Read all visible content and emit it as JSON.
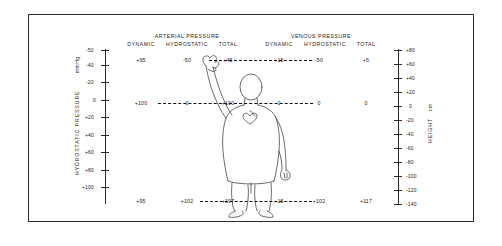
{
  "diagram": {
    "groups": [
      {
        "name": "arterial-pressure",
        "label": "ARTERIAL PRESSURE",
        "columns": [
          "DYNAMIC",
          "HYDROSTATIC",
          "TOTAL"
        ]
      },
      {
        "name": "venous-pressure",
        "label": "VENOUS PRESSURE",
        "columns": [
          "DYNAMIC",
          "HYDROSTATIC",
          "TOTAL"
        ]
      }
    ],
    "levels": [
      {
        "name": "raised-hand-level",
        "arterial": {
          "dynamic": "+95",
          "hydrostatic": "-50",
          "total": "+45"
        },
        "venous": {
          "dynamic": "+15",
          "hydrostatic": "-50",
          "total": "+5"
        }
      },
      {
        "name": "heart-level",
        "arterial": {
          "dynamic": "+100",
          "hydrostatic": "0",
          "total": "+100"
        },
        "venous": {
          "dynamic": "0",
          "hydrostatic": "0",
          "total": "0"
        }
      },
      {
        "name": "foot-level",
        "arterial": {
          "dynamic": "+95",
          "hydrostatic": "+102",
          "total": "+197"
        },
        "venous": {
          "dynamic": "+15",
          "hydrostatic": "+102",
          "total": "+117"
        }
      }
    ],
    "left_axis": {
      "title": "HYDROSTATIC PRESSURE",
      "unit": "mmHg",
      "ticks": [
        "-50",
        "-40",
        "-20",
        "0",
        "+20",
        "+40",
        "+60",
        "+80",
        "+100"
      ]
    },
    "right_axis": {
      "title": "HEIGHT",
      "unit": "cm",
      "ticks": [
        "+80",
        "+60",
        "+40",
        "+20",
        "0",
        "-20",
        "-40",
        "-60",
        "-80",
        "-100",
        "-120",
        "-140"
      ]
    },
    "anatomy": {
      "heart": "heart-icon",
      "figure": "standing-human-figure"
    },
    "colors": {
      "ink": "#1a1a1a",
      "line": "#2b2b2b",
      "background": "#ffffff"
    }
  }
}
